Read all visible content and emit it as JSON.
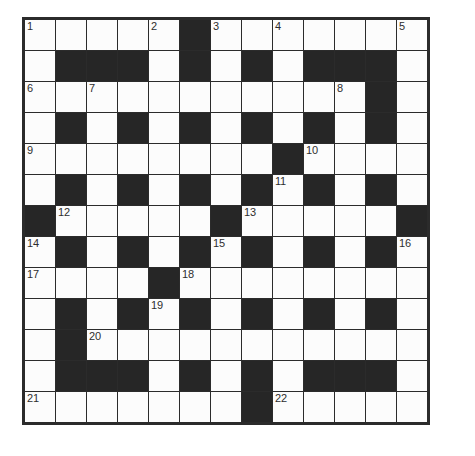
{
  "puzzle": {
    "title": "Crossword Grid",
    "rows": 13,
    "cols": 13,
    "cell_size_px": 31,
    "colors": {
      "white_cell": "#fcfcfc",
      "black_cell": "#262626",
      "grid_line": "#2b2b2b",
      "number_text": "#2e2e2e",
      "page_background": "#ffffff"
    },
    "grid": [
      [
        {
          "type": "white",
          "number": "1"
        },
        {
          "type": "white",
          "number": ""
        },
        {
          "type": "white",
          "number": ""
        },
        {
          "type": "white",
          "number": ""
        },
        {
          "type": "white",
          "number": "2"
        },
        {
          "type": "black",
          "number": ""
        },
        {
          "type": "white",
          "number": "3"
        },
        {
          "type": "white",
          "number": ""
        },
        {
          "type": "white",
          "number": "4"
        },
        {
          "type": "white",
          "number": ""
        },
        {
          "type": "white",
          "number": ""
        },
        {
          "type": "white",
          "number": ""
        },
        {
          "type": "white",
          "number": "5"
        }
      ],
      [
        {
          "type": "white",
          "number": ""
        },
        {
          "type": "black",
          "number": ""
        },
        {
          "type": "black",
          "number": ""
        },
        {
          "type": "black",
          "number": ""
        },
        {
          "type": "white",
          "number": ""
        },
        {
          "type": "black",
          "number": ""
        },
        {
          "type": "white",
          "number": ""
        },
        {
          "type": "black",
          "number": ""
        },
        {
          "type": "white",
          "number": ""
        },
        {
          "type": "black",
          "number": ""
        },
        {
          "type": "black",
          "number": ""
        },
        {
          "type": "black",
          "number": ""
        },
        {
          "type": "white",
          "number": ""
        }
      ],
      [
        {
          "type": "white",
          "number": "6"
        },
        {
          "type": "white",
          "number": ""
        },
        {
          "type": "white",
          "number": "7"
        },
        {
          "type": "white",
          "number": ""
        },
        {
          "type": "white",
          "number": ""
        },
        {
          "type": "white",
          "number": ""
        },
        {
          "type": "white",
          "number": ""
        },
        {
          "type": "white",
          "number": ""
        },
        {
          "type": "white",
          "number": ""
        },
        {
          "type": "white",
          "number": ""
        },
        {
          "type": "white",
          "number": "8"
        },
        {
          "type": "black",
          "number": ""
        },
        {
          "type": "white",
          "number": ""
        }
      ],
      [
        {
          "type": "white",
          "number": ""
        },
        {
          "type": "black",
          "number": ""
        },
        {
          "type": "white",
          "number": ""
        },
        {
          "type": "black",
          "number": ""
        },
        {
          "type": "white",
          "number": ""
        },
        {
          "type": "black",
          "number": ""
        },
        {
          "type": "white",
          "number": ""
        },
        {
          "type": "black",
          "number": ""
        },
        {
          "type": "white",
          "number": ""
        },
        {
          "type": "black",
          "number": ""
        },
        {
          "type": "white",
          "number": ""
        },
        {
          "type": "black",
          "number": ""
        },
        {
          "type": "white",
          "number": ""
        }
      ],
      [
        {
          "type": "white",
          "number": "9"
        },
        {
          "type": "white",
          "number": ""
        },
        {
          "type": "white",
          "number": ""
        },
        {
          "type": "white",
          "number": ""
        },
        {
          "type": "white",
          "number": ""
        },
        {
          "type": "white",
          "number": ""
        },
        {
          "type": "white",
          "number": ""
        },
        {
          "type": "white",
          "number": ""
        },
        {
          "type": "black",
          "number": ""
        },
        {
          "type": "white",
          "number": "10"
        },
        {
          "type": "white",
          "number": ""
        },
        {
          "type": "white",
          "number": ""
        },
        {
          "type": "white",
          "number": ""
        }
      ],
      [
        {
          "type": "white",
          "number": ""
        },
        {
          "type": "black",
          "number": ""
        },
        {
          "type": "white",
          "number": ""
        },
        {
          "type": "black",
          "number": ""
        },
        {
          "type": "white",
          "number": ""
        },
        {
          "type": "black",
          "number": ""
        },
        {
          "type": "white",
          "number": ""
        },
        {
          "type": "black",
          "number": ""
        },
        {
          "type": "white",
          "number": "11"
        },
        {
          "type": "black",
          "number": ""
        },
        {
          "type": "white",
          "number": ""
        },
        {
          "type": "black",
          "number": ""
        },
        {
          "type": "white",
          "number": ""
        }
      ],
      [
        {
          "type": "black",
          "number": ""
        },
        {
          "type": "white",
          "number": "12"
        },
        {
          "type": "white",
          "number": ""
        },
        {
          "type": "white",
          "number": ""
        },
        {
          "type": "white",
          "number": ""
        },
        {
          "type": "white",
          "number": ""
        },
        {
          "type": "black",
          "number": ""
        },
        {
          "type": "white",
          "number": "13"
        },
        {
          "type": "white",
          "number": ""
        },
        {
          "type": "white",
          "number": ""
        },
        {
          "type": "white",
          "number": ""
        },
        {
          "type": "white",
          "number": ""
        },
        {
          "type": "black",
          "number": ""
        }
      ],
      [
        {
          "type": "white",
          "number": "14"
        },
        {
          "type": "black",
          "number": ""
        },
        {
          "type": "white",
          "number": ""
        },
        {
          "type": "black",
          "number": ""
        },
        {
          "type": "white",
          "number": ""
        },
        {
          "type": "black",
          "number": ""
        },
        {
          "type": "white",
          "number": "15"
        },
        {
          "type": "black",
          "number": ""
        },
        {
          "type": "white",
          "number": ""
        },
        {
          "type": "black",
          "number": ""
        },
        {
          "type": "white",
          "number": ""
        },
        {
          "type": "black",
          "number": ""
        },
        {
          "type": "white",
          "number": "16"
        }
      ],
      [
        {
          "type": "white",
          "number": "17"
        },
        {
          "type": "white",
          "number": ""
        },
        {
          "type": "white",
          "number": ""
        },
        {
          "type": "white",
          "number": ""
        },
        {
          "type": "black",
          "number": ""
        },
        {
          "type": "white",
          "number": "18"
        },
        {
          "type": "white",
          "number": ""
        },
        {
          "type": "white",
          "number": ""
        },
        {
          "type": "white",
          "number": ""
        },
        {
          "type": "white",
          "number": ""
        },
        {
          "type": "white",
          "number": ""
        },
        {
          "type": "white",
          "number": ""
        },
        {
          "type": "white",
          "number": ""
        }
      ],
      [
        {
          "type": "white",
          "number": ""
        },
        {
          "type": "black",
          "number": ""
        },
        {
          "type": "white",
          "number": ""
        },
        {
          "type": "black",
          "number": ""
        },
        {
          "type": "white",
          "number": "19"
        },
        {
          "type": "black",
          "number": ""
        },
        {
          "type": "white",
          "number": ""
        },
        {
          "type": "black",
          "number": ""
        },
        {
          "type": "white",
          "number": ""
        },
        {
          "type": "black",
          "number": ""
        },
        {
          "type": "white",
          "number": ""
        },
        {
          "type": "black",
          "number": ""
        },
        {
          "type": "white",
          "number": ""
        }
      ],
      [
        {
          "type": "white",
          "number": ""
        },
        {
          "type": "black",
          "number": ""
        },
        {
          "type": "white",
          "number": "20"
        },
        {
          "type": "white",
          "number": ""
        },
        {
          "type": "white",
          "number": ""
        },
        {
          "type": "white",
          "number": ""
        },
        {
          "type": "white",
          "number": ""
        },
        {
          "type": "white",
          "number": ""
        },
        {
          "type": "white",
          "number": ""
        },
        {
          "type": "white",
          "number": ""
        },
        {
          "type": "white",
          "number": ""
        },
        {
          "type": "white",
          "number": ""
        },
        {
          "type": "white",
          "number": ""
        }
      ],
      [
        {
          "type": "white",
          "number": ""
        },
        {
          "type": "black",
          "number": ""
        },
        {
          "type": "black",
          "number": ""
        },
        {
          "type": "black",
          "number": ""
        },
        {
          "type": "white",
          "number": ""
        },
        {
          "type": "black",
          "number": ""
        },
        {
          "type": "white",
          "number": ""
        },
        {
          "type": "black",
          "number": ""
        },
        {
          "type": "white",
          "number": ""
        },
        {
          "type": "black",
          "number": ""
        },
        {
          "type": "black",
          "number": ""
        },
        {
          "type": "black",
          "number": ""
        },
        {
          "type": "white",
          "number": ""
        }
      ],
      [
        {
          "type": "white",
          "number": "21"
        },
        {
          "type": "white",
          "number": ""
        },
        {
          "type": "white",
          "number": ""
        },
        {
          "type": "white",
          "number": ""
        },
        {
          "type": "white",
          "number": ""
        },
        {
          "type": "white",
          "number": ""
        },
        {
          "type": "white",
          "number": ""
        },
        {
          "type": "black",
          "number": ""
        },
        {
          "type": "white",
          "number": "22"
        },
        {
          "type": "white",
          "number": ""
        },
        {
          "type": "white",
          "number": ""
        },
        {
          "type": "white",
          "number": ""
        },
        {
          "type": "white",
          "number": ""
        }
      ]
    ]
  }
}
